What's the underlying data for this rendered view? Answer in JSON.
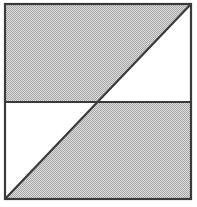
{
  "figure": {
    "name": "shaded-square-diagonal",
    "canvas": {
      "width": 197,
      "height": 207,
      "background": "#ffffff"
    },
    "square": {
      "left": 5,
      "top": 4,
      "right": 191,
      "bottom": 199,
      "width": 186,
      "height": 195
    },
    "colors": {
      "outline": "#3a3a3a",
      "shaded_fill": "#c9c9c9",
      "dither_dot": "#9a9a9a",
      "empty_fill": "#ffffff",
      "page_background": "#ffffff"
    },
    "stroke_width": 2.2,
    "lines": [
      {
        "id": "outline-square",
        "label": "Square outline",
        "kind": "rectangle"
      },
      {
        "id": "horizontal-midline",
        "label": "Horizontal midline",
        "kind": "line",
        "y": 102,
        "x1": 5,
        "x2": 191
      },
      {
        "id": "rising-diagonal",
        "label": "Diagonal from bottom-left to top-right",
        "kind": "line",
        "x1": 5,
        "y1": 199,
        "x2": 191,
        "y2": 4
      }
    ],
    "intersection_point": {
      "x": 98,
      "y": 102,
      "label": "Center"
    },
    "regions": [
      {
        "id": "upper-left-region",
        "label": "Upper left",
        "shading": "shaded",
        "shape": "triangle-plus-band",
        "points": "5,4 191,4 5,199"
      },
      {
        "id": "upper-right-region",
        "label": "Upper right",
        "shading": "empty",
        "shape": "triangle",
        "points": "191,4 191,102 98,102"
      },
      {
        "id": "lower-left-region",
        "label": "Lower left",
        "shading": "empty",
        "shape": "triangle",
        "points": "5,102 98,102 5,199"
      },
      {
        "id": "lower-right-region",
        "label": "Lower right",
        "shading": "shaded",
        "shape": "triangle-plus-band",
        "points": "191,4 191,199 5,199"
      }
    ],
    "shaded_region_ids": [
      "upper-left-region",
      "lower-right-region"
    ],
    "empty_region_ids": [
      "upper-right-region",
      "lower-left-region"
    ]
  }
}
